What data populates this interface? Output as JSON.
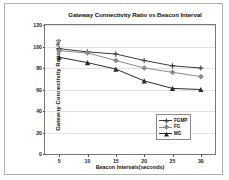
{
  "chart_data": {
    "type": "line",
    "title": "Gateway  Connectivity Ratio vs Beacon Interval",
    "xlabel": "Beacon Intervals(seconds)",
    "ylabel": "Gateway  Connectivity Ratio  ( %)",
    "x": [
      5,
      10,
      15,
      20,
      25,
      30
    ],
    "xticks": [
      "5",
      "10",
      "15",
      "20",
      "25",
      "30"
    ],
    "yticks": [
      "0",
      "20",
      "40",
      "60",
      "80",
      "100",
      "120"
    ],
    "ytickvalues": [
      0,
      20,
      40,
      60,
      80,
      100,
      120
    ],
    "xlim": [
      2.5,
      32.5
    ],
    "ylim": [
      0,
      120
    ],
    "grid": true,
    "legend_position": "lower-right",
    "series": [
      {
        "name": "FGMP",
        "color": "#3b3b3b",
        "marker": "plus",
        "values": [
          98,
          95,
          93,
          87,
          82,
          80
        ]
      },
      {
        "name": "FG",
        "color": "#8a8a8a",
        "marker": "diamond",
        "values": [
          96,
          94,
          87,
          80,
          76,
          72
        ]
      },
      {
        "name": "MG",
        "color": "#2a2a2a",
        "marker": "triangle",
        "values": [
          90,
          85,
          79,
          68,
          61,
          60
        ]
      }
    ]
  }
}
